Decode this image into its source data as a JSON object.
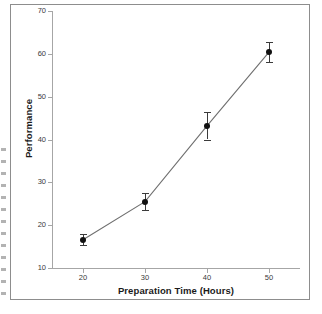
{
  "chart_data": {
    "type": "line",
    "title": "",
    "xlabel": "Preparation Time (Hours)",
    "ylabel": "Performance",
    "x": [
      20,
      30,
      40,
      50
    ],
    "values": [
      16.6,
      25.5,
      43.2,
      60.4
    ],
    "error": [
      1.3,
      1.9,
      3.2,
      2.3
    ],
    "xlim": [
      15,
      55
    ],
    "ylim": [
      10,
      70
    ],
    "xticks": [
      20,
      30,
      40,
      50
    ],
    "yticks": [
      10,
      20,
      30,
      40,
      50,
      60,
      70
    ],
    "xtick_labels": [
      "20",
      "30",
      "40",
      "50"
    ],
    "ytick_labels": [
      "10",
      "20",
      "30",
      "40",
      "50",
      "60",
      "70"
    ],
    "grid": false,
    "legend": false,
    "marker": "filled-circle",
    "line_color": "#6f6f6f",
    "marker_color": "#111111",
    "errorbar_color": "#3b3b3b",
    "axis_color": "#a6a6a6",
    "frame_color": "#8d8d8d",
    "background": "#ffffff"
  }
}
